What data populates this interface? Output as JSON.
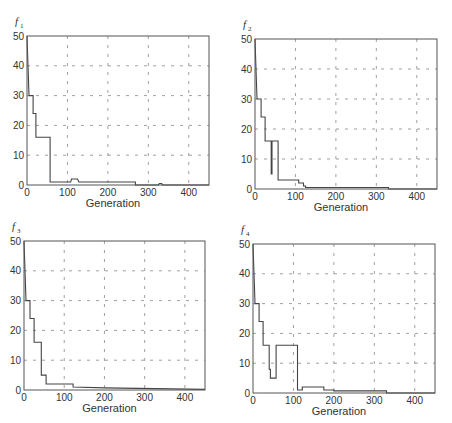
{
  "chart_data": [
    {
      "type": "line",
      "title": "f1",
      "title_main": "f",
      "title_sub": "1",
      "xlabel": "Generation",
      "ylabel": "",
      "xlim": [
        0,
        450
      ],
      "ylim": [
        0,
        50
      ],
      "xticks": [
        0,
        100,
        200,
        300,
        400
      ],
      "yticks": [
        0,
        10,
        20,
        30,
        40,
        50
      ],
      "grid": true,
      "box": {
        "x0": 27,
        "x1": 209,
        "y0": 36,
        "y1": 185
      },
      "series": [
        {
          "name": "f1",
          "x": [
            0,
            5,
            5,
            15,
            15,
            22,
            22,
            57,
            57,
            100,
            100,
            108,
            110,
            125,
            128,
            268,
            268,
            325,
            327,
            333,
            335,
            450
          ],
          "y": [
            50,
            30,
            30,
            30,
            24,
            24,
            16,
            16,
            1,
            1,
            1,
            1,
            2,
            2,
            1,
            1,
            0,
            0,
            0.5,
            0.5,
            0,
            0
          ]
        }
      ]
    },
    {
      "type": "line",
      "title": "f2",
      "title_main": "f",
      "title_sub": "2",
      "xlabel": "Generation",
      "ylabel": "",
      "xlim": [
        0,
        450
      ],
      "ylim": [
        0,
        50
      ],
      "xticks": [
        0,
        100,
        200,
        300,
        400
      ],
      "yticks": [
        0,
        10,
        20,
        30,
        40,
        50
      ],
      "grid": true,
      "box": {
        "x0": 255,
        "x1": 437,
        "y0": 39,
        "y1": 189
      },
      "series": [
        {
          "name": "f2",
          "x": [
            0,
            5,
            5,
            15,
            15,
            25,
            25,
            40,
            40,
            42,
            42,
            47,
            47,
            57,
            57,
            108,
            108,
            110,
            110,
            120,
            120,
            125,
            125,
            330,
            330,
            450
          ],
          "y": [
            50,
            30,
            30,
            30,
            24,
            24,
            16,
            16,
            5,
            5,
            16,
            16,
            16,
            16,
            3,
            3,
            2,
            2,
            2,
            2,
            1,
            1,
            0.5,
            0.5,
            0,
            0
          ]
        }
      ]
    },
    {
      "type": "line",
      "title": "f3",
      "title_main": "f",
      "title_sub": "3",
      "xlabel": "Generation",
      "ylabel": "",
      "xlim": [
        0,
        450
      ],
      "ylim": [
        0,
        50
      ],
      "xticks": [
        0,
        100,
        200,
        300,
        400
      ],
      "yticks": [
        0,
        10,
        20,
        30,
        40,
        50
      ],
      "grid": true,
      "box": {
        "x0": 24,
        "x1": 205,
        "y0": 241,
        "y1": 390
      },
      "series": [
        {
          "name": "f3",
          "x": [
            0,
            5,
            5,
            15,
            15,
            25,
            25,
            43,
            43,
            55,
            55,
            122,
            122,
            200,
            450
          ],
          "y": [
            50,
            30,
            30,
            30,
            24,
            24,
            16,
            16,
            5,
            5,
            2,
            2,
            1,
            0.7,
            0.2
          ]
        }
      ]
    },
    {
      "type": "line",
      "title": "f4",
      "title_main": "f",
      "title_sub": "4",
      "xlabel": "Generation",
      "ylabel": "",
      "xlim": [
        0,
        450
      ],
      "ylim": [
        0,
        50
      ],
      "xticks": [
        0,
        100,
        200,
        300,
        400
      ],
      "yticks": [
        0,
        10,
        20,
        30,
        40,
        50
      ],
      "grid": true,
      "box": {
        "x0": 253,
        "x1": 435,
        "y0": 244,
        "y1": 393
      },
      "series": [
        {
          "name": "f4",
          "x": [
            0,
            5,
            5,
            15,
            15,
            25,
            25,
            40,
            40,
            43,
            43,
            57,
            57,
            110,
            110,
            122,
            122,
            175,
            175,
            200,
            200,
            330,
            330,
            450
          ],
          "y": [
            50,
            30,
            30,
            30,
            24,
            24,
            16,
            16,
            8,
            8,
            5,
            5,
            16,
            16,
            1,
            1,
            2,
            2,
            1,
            1,
            0.7,
            0.7,
            0,
            0
          ]
        }
      ]
    }
  ],
  "colors": {
    "line": "#444444",
    "axes": "#555555",
    "grid": "#777777",
    "text": "#333333"
  }
}
